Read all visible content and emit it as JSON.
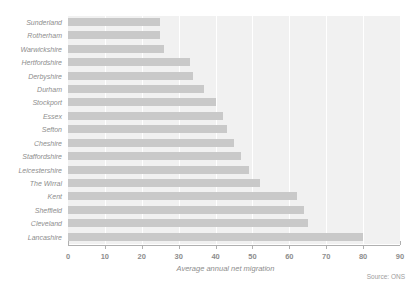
{
  "chart_data": {
    "type": "bar",
    "orientation": "horizontal",
    "title": "",
    "xlabel": "Average annual net migration",
    "ylabel": "",
    "xlim": [
      0,
      90
    ],
    "ticks": [
      0,
      10,
      20,
      30,
      40,
      50,
      60,
      70,
      80,
      90
    ],
    "grid": true,
    "grid_axis": "x",
    "legend": false,
    "source": "Source: ONS",
    "categories": [
      "Sunderland",
      "Rotherham",
      "Warwickshire",
      "Hertfordshire",
      "Derbyshire",
      "Durham",
      "Stockport",
      "Essex",
      "Sefton",
      "Cheshire",
      "Staffordshire",
      "Leicestershire",
      "The Wirral",
      "Kent",
      "Sheffield",
      "Cleveland",
      "Lancashire"
    ],
    "values": [
      25,
      25,
      26,
      33,
      34,
      37,
      40,
      42,
      43,
      45,
      47,
      49,
      52,
      62,
      64,
      65,
      80
    ],
    "bar_color": "#c9c9c9",
    "panel_color": "#f1f1f1",
    "gridline_color": "#ffffff",
    "text_color": "#8d8d8d"
  }
}
